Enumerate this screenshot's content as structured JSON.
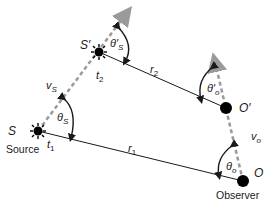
{
  "diagram": {
    "colors": {
      "line": "#1a1a1a",
      "velocity_dashed": "#9a9a9a",
      "dot": "#000000"
    },
    "points": {
      "source_start": {
        "label": "S",
        "sub_label": "Source",
        "time": "t",
        "time_sub": "1"
      },
      "source_end": {
        "label": "S′",
        "time": "t",
        "time_sub": "2"
      },
      "observer_start": {
        "label": "O",
        "sub_label": "Observer"
      },
      "observer_end": {
        "label": "O′"
      }
    },
    "distances": {
      "r1": {
        "base": "r",
        "sub": "1"
      },
      "r2": {
        "base": "r",
        "sub": "2"
      }
    },
    "velocities": {
      "source": {
        "base": "v",
        "sub": "S"
      },
      "observer": {
        "base": "v",
        "sub": "o"
      }
    },
    "angles": {
      "theta_s": {
        "base": "θ",
        "sub": "S"
      },
      "theta_s_prime": {
        "base": "θ′",
        "sub": "S"
      },
      "theta_o": {
        "base": "θ",
        "sub": "o"
      },
      "theta_o_prime": {
        "base": "θ′",
        "sub": "o"
      }
    }
  }
}
